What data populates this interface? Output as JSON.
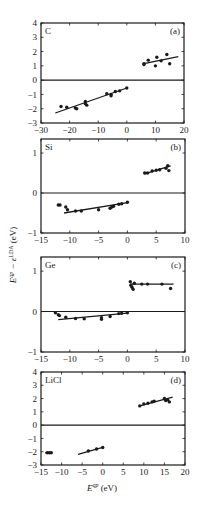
{
  "figure": {
    "ylabel": "E^qp − ε^LDA (eV)",
    "ylabel_main": "E",
    "ylabel_sup1": "qp",
    "ylabel_mid": " − ε",
    "ylabel_sup2": "LDA",
    "ylabel_unit": " (eV)",
    "xlabel_main": "E",
    "xlabel_sup": "qp",
    "xlabel_unit": " (eV)"
  },
  "chart_data": [
    {
      "type": "scatter",
      "panel": "(a)",
      "material": "C",
      "xlabel": "E^qp (eV)",
      "ylabel": "E^qp − ε^LDA (eV)",
      "xlim": [
        -30,
        20
      ],
      "ylim": [
        -3,
        4
      ],
      "xticks": [
        -30,
        -20,
        -10,
        0,
        10,
        20
      ],
      "yticks": [
        -3,
        -2,
        -1,
        0,
        1,
        2,
        3,
        4
      ],
      "hline": 0,
      "grid": false,
      "frame": {
        "x0": 41,
        "x1": 184,
        "y0": 23,
        "y1": 123
      },
      "points": [
        {
          "x": -23,
          "y": -1.85
        },
        {
          "x": -21,
          "y": -1.9
        },
        {
          "x": -18,
          "y": -1.95
        },
        {
          "x": -17.5,
          "y": -2.0
        },
        {
          "x": -14.5,
          "y": -1.5
        },
        {
          "x": -14.5,
          "y": -1.65
        },
        {
          "x": -14,
          "y": -1.75
        },
        {
          "x": -7,
          "y": -0.95
        },
        {
          "x": -5.5,
          "y": -1.0
        },
        {
          "x": -5.5,
          "y": -1.1
        },
        {
          "x": -4,
          "y": -0.8
        },
        {
          "x": -2.5,
          "y": -0.75
        },
        {
          "x": 0,
          "y": -0.55
        },
        {
          "x": 6,
          "y": 1.15
        },
        {
          "x": 6,
          "y": 1.1
        },
        {
          "x": 7.5,
          "y": 1.4
        },
        {
          "x": 10,
          "y": 1.0
        },
        {
          "x": 10.5,
          "y": 1.6
        },
        {
          "x": 12,
          "y": 1.35
        },
        {
          "x": 14,
          "y": 1.8
        },
        {
          "x": 15,
          "y": 1.15
        }
      ],
      "fit_lines": [
        {
          "x": [
            -25,
            0
          ],
          "y": [
            -2.3,
            -0.55
          ]
        },
        {
          "x": [
            6,
            18
          ],
          "y": [
            1.15,
            1.65
          ]
        }
      ],
      "label_pos": "top-left",
      "tag_pos": "top-right"
    },
    {
      "type": "scatter",
      "panel": "(b)",
      "material": "Si",
      "xlabel": "E^qp (eV)",
      "ylabel": "E^qp − ε^LDA (eV)",
      "xlim": [
        -15,
        10
      ],
      "ylim": [
        -1,
        1.35
      ],
      "xticks": [
        -15,
        -10,
        -5,
        0,
        5,
        10
      ],
      "yticks": [
        -1,
        0,
        1
      ],
      "hline": 0,
      "grid": false,
      "frame": {
        "x0": 41,
        "x1": 185,
        "y0": 139,
        "y1": 233
      },
      "points": [
        {
          "x": -12,
          "y": -0.3
        },
        {
          "x": -11.7,
          "y": -0.3
        },
        {
          "x": -10.7,
          "y": -0.35
        },
        {
          "x": -10.4,
          "y": -0.42
        },
        {
          "x": -9,
          "y": -0.45
        },
        {
          "x": -8,
          "y": -0.45
        },
        {
          "x": -5,
          "y": -0.42
        },
        {
          "x": -3,
          "y": -0.38
        },
        {
          "x": -2.7,
          "y": -0.35
        },
        {
          "x": -2.4,
          "y": -0.33
        },
        {
          "x": -1.5,
          "y": -0.28
        },
        {
          "x": -1,
          "y": -0.27
        },
        {
          "x": 0,
          "y": -0.23
        },
        {
          "x": 3,
          "y": 0.5
        },
        {
          "x": 3.5,
          "y": 0.5
        },
        {
          "x": 4.3,
          "y": 0.55
        },
        {
          "x": 5,
          "y": 0.57
        },
        {
          "x": 5.6,
          "y": 0.58
        },
        {
          "x": 6.7,
          "y": 0.62
        },
        {
          "x": 7,
          "y": 0.68
        },
        {
          "x": 7.2,
          "y": 0.56
        }
      ],
      "fit_lines": [
        {
          "x": [
            -11,
            0
          ],
          "y": [
            -0.5,
            -0.24
          ]
        },
        {
          "x": [
            3,
            7.5
          ],
          "y": [
            0.48,
            0.68
          ]
        }
      ],
      "label_pos": "top-left",
      "tag_pos": "top-right"
    },
    {
      "type": "scatter",
      "panel": "(c)",
      "material": "Ge",
      "xlabel": "E^qp (eV)",
      "ylabel": "E^qp − ε^LDA (eV)",
      "xlim": [
        -15,
        10
      ],
      "ylim": [
        -1,
        1.35
      ],
      "xticks": [
        -15,
        -10,
        -5,
        0,
        5,
        10
      ],
      "yticks": [
        -1,
        0,
        1
      ],
      "hline": 0,
      "grid": false,
      "frame": {
        "x0": 41,
        "x1": 185,
        "y0": 257,
        "y1": 352
      },
      "points": [
        {
          "x": -12.5,
          "y": -0.03
        },
        {
          "x": -12,
          "y": -0.08
        },
        {
          "x": -11.8,
          "y": -0.1
        },
        {
          "x": -10.7,
          "y": -0.14
        },
        {
          "x": -9,
          "y": -0.17
        },
        {
          "x": -7.5,
          "y": -0.18
        },
        {
          "x": -4.5,
          "y": -0.15
        },
        {
          "x": -4.5,
          "y": -0.19
        },
        {
          "x": -3,
          "y": -0.12
        },
        {
          "x": -1.5,
          "y": -0.05
        },
        {
          "x": -1,
          "y": -0.04
        },
        {
          "x": 0,
          "y": -0.03
        },
        {
          "x": 0.5,
          "y": 0.74
        },
        {
          "x": 0.6,
          "y": 0.65
        },
        {
          "x": 0.8,
          "y": 0.6
        },
        {
          "x": 1.0,
          "y": 0.55
        },
        {
          "x": 1.2,
          "y": 0.7
        },
        {
          "x": 2.5,
          "y": 0.68
        },
        {
          "x": 3.5,
          "y": 0.68
        },
        {
          "x": 6,
          "y": 0.68
        },
        {
          "x": 7.5,
          "y": 0.57
        }
      ],
      "fit_lines": [
        {
          "x": [
            -12,
            0
          ],
          "y": [
            -0.2,
            -0.04
          ]
        },
        {
          "x": [
            0.5,
            8
          ],
          "y": [
            0.68,
            0.68
          ]
        }
      ],
      "label_pos": "top-left",
      "tag_pos": "top-right"
    },
    {
      "type": "scatter",
      "panel": "(d)",
      "material": "LiCl",
      "xlabel": "E^qp (eV)",
      "ylabel": "E^qp − ε^LDA (eV)",
      "xlim": [
        -15,
        20
      ],
      "ylim": [
        -3,
        4
      ],
      "xticks": [
        -15,
        -10,
        -5,
        0,
        5,
        10,
        15,
        20
      ],
      "yticks": [
        -3,
        -2,
        -1,
        0,
        1,
        2,
        3,
        4
      ],
      "hline": 0,
      "grid": false,
      "frame": {
        "x0": 41,
        "x1": 185,
        "y0": 372,
        "y1": 465
      },
      "points": [
        {
          "x": -13.5,
          "y": -2.08
        },
        {
          "x": -13,
          "y": -2.08
        },
        {
          "x": -12.5,
          "y": -2.08
        },
        {
          "x": -3.5,
          "y": -1.95
        },
        {
          "x": -1.5,
          "y": -1.8
        },
        {
          "x": 0,
          "y": -1.68
        },
        {
          "x": 9,
          "y": 1.45
        },
        {
          "x": 10,
          "y": 1.6
        },
        {
          "x": 11,
          "y": 1.65
        },
        {
          "x": 12,
          "y": 1.75
        },
        {
          "x": 12.5,
          "y": 1.8
        },
        {
          "x": 15,
          "y": 2.0
        },
        {
          "x": 15.3,
          "y": 1.85
        },
        {
          "x": 15.8,
          "y": 1.9
        },
        {
          "x": 16.2,
          "y": 1.75
        }
      ],
      "fit_lines": [
        {
          "x": [
            -14,
            -12.5
          ],
          "y": [
            -2.08,
            -2.08
          ]
        },
        {
          "x": [
            -6,
            0
          ],
          "y": [
            -2.2,
            -1.68
          ]
        },
        {
          "x": [
            9,
            17
          ],
          "y": [
            1.45,
            2.1
          ]
        }
      ],
      "label_pos": "top-left",
      "tag_pos": "top-right"
    }
  ]
}
